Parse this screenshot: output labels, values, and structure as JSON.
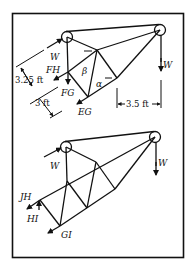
{
  "figure": {
    "border_color": "#111111",
    "background": "#ffffff",
    "top_panel": {
      "labels": {
        "w_left": "W",
        "w_right": "W",
        "fh": "FH",
        "fg": "FG",
        "eg": "EG",
        "beta": "β",
        "alpha": "α"
      },
      "dimensions": {
        "d1": "3.25 ft",
        "d2": "3 ft",
        "d3": "3.5 ft"
      }
    },
    "bottom_panel": {
      "labels": {
        "w_left": "W",
        "w_right": "W",
        "jh": "JH",
        "hi": "HI",
        "gi": "GI"
      }
    }
  }
}
